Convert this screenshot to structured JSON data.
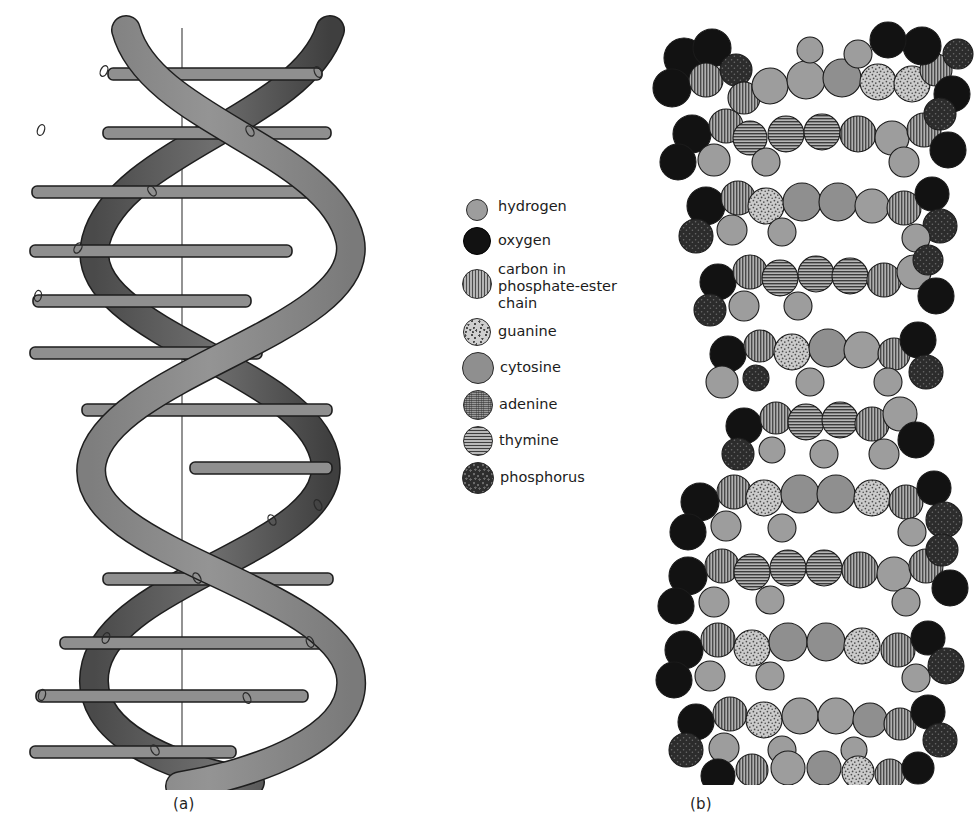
{
  "figure": {
    "panels": [
      {
        "id": "a",
        "caption": "(a)",
        "kind": "ribbon-helix-diagram"
      },
      {
        "id": "b",
        "caption": "(b)",
        "kind": "space-filling-model"
      }
    ]
  },
  "legend": {
    "items": [
      {
        "key": "hydrogen",
        "label": "hydrogen",
        "texture": "plain-light",
        "size": 22,
        "color": "#9d9d9d"
      },
      {
        "key": "oxygen",
        "label": "oxygen",
        "texture": "black",
        "size": 28,
        "color": "#121212"
      },
      {
        "key": "carbon",
        "label": "carbon in\nphosphate-ester\nchain",
        "texture": "vstripe",
        "size": 30,
        "color": "#8a8a8a"
      },
      {
        "key": "guanine",
        "label": "guanine",
        "texture": "speckle",
        "size": 28,
        "color": "#cfcfcf"
      },
      {
        "key": "cytosine",
        "label": "cytosine",
        "texture": "plain-mid",
        "size": 32,
        "color": "#8f8f8f"
      },
      {
        "key": "adenine",
        "label": "adenine",
        "texture": "fine",
        "size": 30,
        "color": "#9a9a9a"
      },
      {
        "key": "thymine",
        "label": "thymine",
        "texture": "hstripe",
        "size": 30,
        "color": "#8d8d8d"
      },
      {
        "key": "phosphorus",
        "label": "phosphorus",
        "texture": "darkstipple",
        "size": 32,
        "color": "#2e2e2e"
      }
    ]
  },
  "panel_a": {
    "ribbon_fill": "#8a8a8a",
    "ribbon_shadow": "#555555",
    "outline": "#1e1e1e",
    "axis_color": "#3a3a3a",
    "rung_fill": "#8f8f8f",
    "rung_count": 13,
    "marker_shape": "small-oval",
    "axis_x": 182
  },
  "panel_b": {
    "atom_colors": {
      "hydrogen": "#9d9d9d",
      "oxygen": "#121212",
      "carbon": "#8a8a8a",
      "guanine": "#cfcfcf",
      "cytosine": "#8f8f8f",
      "adenine": "#9a9a9a",
      "thymine": "#8d8d8d",
      "phosphorus": "#2e2e2e"
    },
    "outline": "#1b1b1b",
    "layer_count": 11,
    "description": "space-filling DNA double helix"
  }
}
